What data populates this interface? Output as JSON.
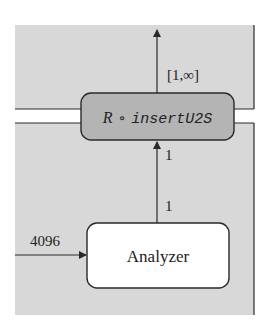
{
  "diagram": {
    "colors": {
      "panel_fill": "#d8d8d8",
      "stroke": "#2a2a2a",
      "filter_box_fill": "#b4b4b4",
      "analyzer_box_fill": "#ffffff",
      "background": "#ffffff"
    },
    "nodes": {
      "filter": {
        "prefix": "R",
        "operator": "∘",
        "name": "insertU2S"
      },
      "analyzer": {
        "label": "Analyzer"
      }
    },
    "edges": {
      "input_to_analyzer": {
        "label": "4096"
      },
      "analyzer_to_filter": {
        "source_label": "1",
        "target_label": "1"
      },
      "filter_output": {
        "label": "[1,∞]"
      }
    }
  }
}
